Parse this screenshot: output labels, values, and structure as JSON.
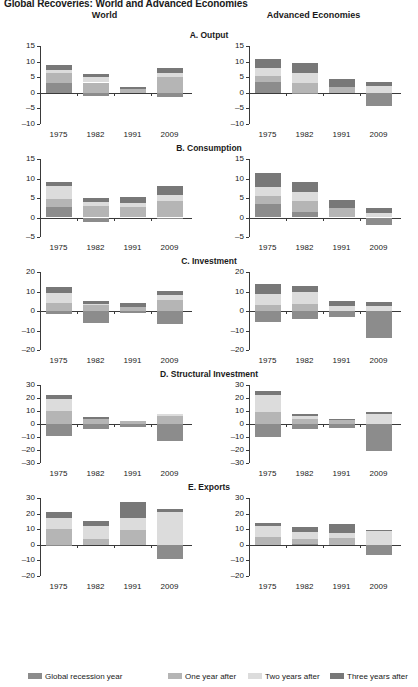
{
  "figure": {
    "title": "Global Recoveries: World and Advanced Economies",
    "columns": [
      {
        "key": "world",
        "label": "World"
      },
      {
        "key": "advanced",
        "label": "Advanced Economies"
      }
    ]
  },
  "legend": {
    "position": "bottom",
    "items": [
      {
        "label": "Global recession year",
        "color": "#8c8c8c"
      },
      {
        "label": "One year after",
        "color": "#b5b5b5"
      },
      {
        "label": "Two years after",
        "color": "#dcdcdc"
      },
      {
        "label": "Three years after",
        "color": "#787878"
      }
    ]
  },
  "chart_data": [
    {
      "id": "A-world",
      "type": "bar",
      "stacked": true,
      "title": "A. Output",
      "column": "World",
      "xlabel": "",
      "ylabel": "",
      "ylim": [
        -10,
        15
      ],
      "yticks": [
        15,
        10,
        5,
        0,
        -5,
        -10
      ],
      "grid": false,
      "categories": [
        "1975",
        "1982",
        "1991",
        "2009"
      ],
      "series": [
        {
          "name": "Global recession year",
          "color": "#8c8c8c",
          "values": [
            3.3,
            -1.0,
            0.0,
            -1.5
          ]
        },
        {
          "name": "One year after",
          "color": "#b5b5b5",
          "values": [
            3.0,
            3.3,
            1.2,
            5.0
          ]
        },
        {
          "name": "Two years after",
          "color": "#dcdcdc",
          "values": [
            1.1,
            1.7,
            0.0,
            1.2
          ]
        },
        {
          "name": "Three years after",
          "color": "#787878",
          "values": [
            1.6,
            1.0,
            0.8,
            1.8
          ]
        }
      ]
    },
    {
      "id": "A-advanced",
      "type": "bar",
      "stacked": true,
      "title": "A. Output",
      "column": "Advanced Economies",
      "xlabel": "",
      "ylabel": "",
      "ylim": [
        -10,
        15
      ],
      "yticks": [
        15,
        10,
        5,
        0,
        -5,
        -10
      ],
      "grid": false,
      "categories": [
        "1975",
        "1982",
        "1991",
        "2009"
      ],
      "series": [
        {
          "name": "Global recession year",
          "color": "#8c8c8c",
          "values": [
            3.6,
            -0.4,
            0.0,
            -4.3
          ]
        },
        {
          "name": "One year after",
          "color": "#b5b5b5",
          "values": [
            1.9,
            3.1,
            1.9,
            0.0
          ]
        },
        {
          "name": "Two years after",
          "color": "#dcdcdc",
          "values": [
            2.5,
            3.4,
            0.0,
            2.2
          ]
        },
        {
          "name": "Three years after",
          "color": "#787878",
          "values": [
            2.8,
            3.0,
            2.4,
            1.2
          ]
        }
      ]
    },
    {
      "id": "B-world",
      "type": "bar",
      "stacked": true,
      "title": "B. Consumption",
      "column": "World",
      "xlabel": "",
      "ylabel": "",
      "ylim": [
        -5,
        15
      ],
      "yticks": [
        15,
        10,
        5,
        0,
        -5
      ],
      "grid": false,
      "categories": [
        "1975",
        "1982",
        "1991",
        "2009"
      ],
      "series": [
        {
          "name": "Global recession year",
          "color": "#8c8c8c",
          "values": [
            2.8,
            -1.2,
            0.0,
            -0.3
          ]
        },
        {
          "name": "One year after",
          "color": "#b5b5b5",
          "values": [
            1.9,
            2.9,
            2.6,
            4.2
          ]
        },
        {
          "name": "Two years after",
          "color": "#dcdcdc",
          "values": [
            3.5,
            1.0,
            1.2,
            1.6
          ]
        },
        {
          "name": "Three years after",
          "color": "#787878",
          "values": [
            0.9,
            1.1,
            1.5,
            2.2
          ]
        }
      ]
    },
    {
      "id": "B-advanced",
      "type": "bar",
      "stacked": true,
      "title": "B. Consumption",
      "column": "Advanced Economies",
      "xlabel": "",
      "ylabel": "",
      "ylim": [
        -5,
        15
      ],
      "yticks": [
        15,
        10,
        5,
        0,
        -5
      ],
      "grid": false,
      "categories": [
        "1975",
        "1982",
        "1991",
        "2009"
      ],
      "series": [
        {
          "name": "Global recession year",
          "color": "#8c8c8c",
          "values": [
            3.4,
            1.4,
            0.0,
            -2.0
          ]
        },
        {
          "name": "One year after",
          "color": "#b5b5b5",
          "values": [
            2.1,
            2.8,
            2.4,
            0.0
          ]
        },
        {
          "name": "Two years after",
          "color": "#dcdcdc",
          "values": [
            2.4,
            2.4,
            0.0,
            1.1
          ]
        },
        {
          "name": "Three years after",
          "color": "#787878",
          "values": [
            3.4,
            2.4,
            2.2,
            1.3
          ]
        }
      ]
    },
    {
      "id": "C-world",
      "type": "bar",
      "stacked": true,
      "title": "C. Investment",
      "column": "World",
      "xlabel": "",
      "ylabel": "",
      "ylim": [
        -20,
        20
      ],
      "yticks": [
        20,
        10,
        0,
        -10,
        -20
      ],
      "grid": false,
      "categories": [
        "1975",
        "1982",
        "1991",
        "2009"
      ],
      "series": [
        {
          "name": "Global recession year",
          "color": "#8c8c8c",
          "values": [
            -1.4,
            -6.0,
            -1.1,
            -6.6
          ]
        },
        {
          "name": "One year after",
          "color": "#b5b5b5",
          "values": [
            4.0,
            3.0,
            2.0,
            5.7
          ]
        },
        {
          "name": "Two years after",
          "color": "#dcdcdc",
          "values": [
            5.0,
            0.8,
            0.0,
            2.4
          ]
        },
        {
          "name": "Three years after",
          "color": "#787878",
          "values": [
            3.4,
            1.5,
            2.2,
            2.4
          ]
        }
      ]
    },
    {
      "id": "C-advanced",
      "type": "bar",
      "stacked": true,
      "title": "C. Investment",
      "column": "Advanced Economies",
      "xlabel": "",
      "ylabel": "",
      "ylim": [
        -20,
        20
      ],
      "yticks": [
        20,
        10,
        0,
        -10,
        -20
      ],
      "grid": false,
      "categories": [
        "1975",
        "1982",
        "1991",
        "2009"
      ],
      "series": [
        {
          "name": "Global recession year",
          "color": "#8c8c8c",
          "values": [
            -5.8,
            -4.0,
            -3.0,
            -13.8
          ]
        },
        {
          "name": "One year after",
          "color": "#b5b5b5",
          "values": [
            3.2,
            3.4,
            0.0,
            0.0
          ]
        },
        {
          "name": "Two years after",
          "color": "#dcdcdc",
          "values": [
            5.4,
            6.2,
            2.7,
            2.6
          ]
        },
        {
          "name": "Three years after",
          "color": "#787878",
          "values": [
            5.2,
            3.4,
            2.4,
            1.8
          ]
        }
      ]
    },
    {
      "id": "D-world",
      "type": "bar",
      "stacked": true,
      "title": "D. Structural Investment",
      "column": "World",
      "xlabel": "",
      "ylabel": "",
      "ylim": [
        -30,
        30
      ],
      "yticks": [
        30,
        20,
        10,
        0,
        -10,
        -20,
        -30
      ],
      "grid": false,
      "categories": [
        "1975",
        "1982",
        "1991",
        "2009"
      ],
      "series": [
        {
          "name": "Global recession year",
          "color": "#8c8c8c",
          "values": [
            -9.2,
            -4.2,
            -2.0,
            -13.0
          ]
        },
        {
          "name": "One year after",
          "color": "#b5b5b5",
          "values": [
            9.8,
            4.2,
            2.0,
            6.0
          ]
        },
        {
          "name": "Two years after",
          "color": "#dcdcdc",
          "values": [
            9.6,
            0.0,
            0.0,
            1.5
          ]
        },
        {
          "name": "Three years after",
          "color": "#787878",
          "values": [
            2.8,
            1.0,
            0.0,
            0.0
          ]
        }
      ]
    },
    {
      "id": "D-advanced",
      "type": "bar",
      "stacked": true,
      "title": "D. Structural Investment",
      "column": "Advanced Economies",
      "xlabel": "",
      "ylabel": "",
      "ylim": [
        -30,
        30
      ],
      "yticks": [
        30,
        20,
        10,
        0,
        -10,
        -20,
        -30
      ],
      "grid": false,
      "categories": [
        "1975",
        "1982",
        "1991",
        "2009"
      ],
      "series": [
        {
          "name": "Global recession year",
          "color": "#8c8c8c",
          "values": [
            -10.2,
            -4.0,
            -3.0,
            -21.0
          ]
        },
        {
          "name": "One year after",
          "color": "#b5b5b5",
          "values": [
            9.0,
            4.0,
            3.0,
            0.0
          ]
        },
        {
          "name": "Two years after",
          "color": "#dcdcdc",
          "values": [
            13.6,
            2.4,
            0.0,
            7.5
          ]
        },
        {
          "name": "Three years after",
          "color": "#787878",
          "values": [
            2.8,
            1.4,
            0.8,
            1.4
          ]
        }
      ]
    },
    {
      "id": "E-world",
      "type": "bar",
      "stacked": true,
      "title": "E. Exports",
      "column": "World",
      "xlabel": "",
      "ylabel": "",
      "ylim": [
        -20,
        30
      ],
      "yticks": [
        30,
        20,
        10,
        0,
        -10,
        -20
      ],
      "grid": false,
      "categories": [
        "1975",
        "1982",
        "1991",
        "2009"
      ],
      "series": [
        {
          "name": "Global recession year",
          "color": "#8c8c8c",
          "values": [
            -1.0,
            0.0,
            0.0,
            -9.2
          ]
        },
        {
          "name": "One year after",
          "color": "#b5b5b5",
          "values": [
            10.4,
            3.4,
            9.2,
            0.0
          ]
        },
        {
          "name": "Two years after",
          "color": "#dcdcdc",
          "values": [
            7.0,
            8.6,
            8.0,
            21.0
          ]
        },
        {
          "name": "Three years after",
          "color": "#787878",
          "values": [
            3.6,
            3.0,
            10.0,
            2.2
          ]
        }
      ]
    },
    {
      "id": "E-advanced",
      "type": "bar",
      "stacked": true,
      "title": "E. Exports",
      "column": "Advanced Economies",
      "xlabel": "",
      "ylabel": "",
      "ylim": [
        -20,
        30
      ],
      "yticks": [
        30,
        20,
        10,
        0,
        -10,
        -20
      ],
      "grid": false,
      "categories": [
        "1975",
        "1982",
        "1991",
        "2009"
      ],
      "series": [
        {
          "name": "Global recession year",
          "color": "#8c8c8c",
          "values": [
            0.0,
            0.8,
            0.0,
            -6.8
          ]
        },
        {
          "name": "One year after",
          "color": "#b5b5b5",
          "values": [
            5.2,
            3.0,
            4.2,
            0.0
          ]
        },
        {
          "name": "Two years after",
          "color": "#dcdcdc",
          "values": [
            6.6,
            4.2,
            3.4,
            8.8
          ]
        },
        {
          "name": "Three years after",
          "color": "#787878",
          "values": [
            2.4,
            3.2,
            6.0,
            0.6
          ]
        }
      ]
    }
  ]
}
